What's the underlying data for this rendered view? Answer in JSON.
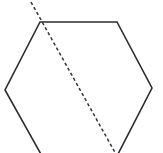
{
  "figure": {
    "background_color": "#ffffff",
    "width": 163,
    "height": 153,
    "shape": {
      "name": "hexagon",
      "stroke_color": "#2b2b33",
      "stroke_width": 1.6,
      "fill": "none",
      "vertices": [
        {
          "label": "top-left",
          "x": 40,
          "y": 22
        },
        {
          "label": "top-right",
          "x": 117,
          "y": 22
        },
        {
          "label": "right",
          "x": 152,
          "y": 88
        },
        {
          "label": "bottom-right",
          "x": 117,
          "y": 156
        },
        {
          "label": "bottom-left",
          "x": 42,
          "y": 156
        },
        {
          "label": "left",
          "x": 5,
          "y": 90
        }
      ],
      "points_attr": "40,22 117,22 152,88 117,156 42,156 5,90"
    },
    "dashed_line": {
      "name": "diagonal",
      "stroke_color": "#33333b",
      "stroke_width": 1.5,
      "dash_pattern": "3.2 2.6",
      "start": {
        "x": 31,
        "y": 2
      },
      "end": {
        "x": 117,
        "y": 156
      },
      "d_attr": "M 31 2 L 117 156",
      "note": "extends past the top-left vertex and runs to the bottom-right vertex"
    }
  }
}
